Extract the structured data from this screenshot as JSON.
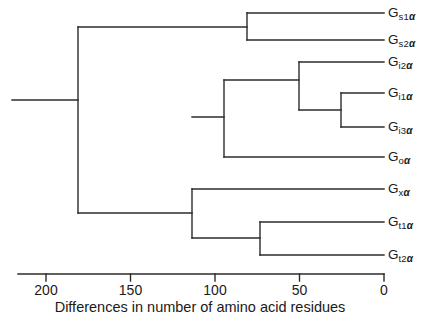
{
  "figure": {
    "type": "dendrogram",
    "caption": "Differences in number of amino acid residues",
    "line_color": "#2b2b2b",
    "background_color": "#ffffff"
  },
  "axis": {
    "orientation": "horizontal",
    "reversed": true,
    "min": 0,
    "max": 200,
    "tick_values": [
      200,
      150,
      100,
      50,
      0
    ],
    "tick_labels": [
      "200",
      "150",
      "100",
      "50",
      "0"
    ],
    "label": "Differences in number of amino acid residues",
    "pixel_for_max": 46,
    "pixel_for_min": 384
  },
  "tips": [
    {
      "id": "gs1a",
      "base": "G",
      "sub": "s1",
      "greek": "α",
      "label": "Gs1α",
      "y": 13,
      "branch_x": 247
    },
    {
      "id": "gs2a",
      "base": "G",
      "sub": "s2",
      "greek": "α",
      "label": "Gs2α",
      "y": 40,
      "branch_x": 247
    },
    {
      "id": "gi2a",
      "base": "G",
      "sub": "i2",
      "greek": "α",
      "label": "Gi2α",
      "y": 62,
      "branch_x": 299
    },
    {
      "id": "gi1a",
      "base": "G",
      "sub": "i1",
      "greek": "α",
      "label": "Gi1α",
      "y": 93,
      "branch_x": 341
    },
    {
      "id": "gi3a",
      "base": "G",
      "sub": "i3",
      "greek": "α",
      "label": "Gi3α",
      "y": 127,
      "branch_x": 341
    },
    {
      "id": "goa",
      "base": "G",
      "sub": "o",
      "greek": "α",
      "label": "Goα",
      "y": 157,
      "branch_x": 224
    },
    {
      "id": "gxa",
      "base": "G",
      "sub": "x",
      "greek": "α",
      "label": "Gxα",
      "y": 189,
      "branch_x": 192
    },
    {
      "id": "gt1a",
      "base": "G",
      "sub": "t1",
      "greek": "α",
      "label": "Gt1α",
      "y": 222,
      "branch_x": 260
    },
    {
      "id": "gt2a",
      "base": "G",
      "sub": "t2",
      "greek": "α",
      "label": "Gt2α",
      "y": 255,
      "branch_x": 260
    }
  ],
  "chart_data": {
    "type": "tree",
    "title": "",
    "xlabel": "Differences in number of amino acid residues",
    "ylabel": "",
    "xlim": [
      200,
      0
    ],
    "grid": false,
    "legend": "none",
    "leaves": [
      "Gs1α",
      "Gs2α",
      "Gi2α",
      "Gi1α",
      "Gi3α",
      "Goα",
      "Gxα",
      "Gt1α",
      "Gt2α"
    ],
    "nodes": [
      {
        "name": "root",
        "height": 178,
        "children": [
          "n_s",
          "n_rest"
        ]
      },
      {
        "name": "n_s",
        "height": 81,
        "children": [
          "Gs1α",
          "Gs2α"
        ]
      },
      {
        "name": "n_rest",
        "height": 114,
        "children": [
          "n_io",
          "n_xt"
        ]
      },
      {
        "name": "n_io",
        "height": 95,
        "children": [
          "n_i",
          "Goα"
        ]
      },
      {
        "name": "n_i",
        "height": 50,
        "children": [
          "Gi2α",
          "n_i13"
        ]
      },
      {
        "name": "n_i13",
        "height": 25,
        "children": [
          "Gi1α",
          "Gi3α"
        ]
      },
      {
        "name": "n_xt",
        "height": 114,
        "children": [
          "Gxα",
          "n_t"
        ]
      },
      {
        "name": "n_t",
        "height": 73,
        "children": [
          "Gt1α",
          "Gt2α"
        ]
      }
    ]
  },
  "geometry": {
    "root_stem_x_start": 12,
    "root_node_x": 78,
    "root_node_y_top": 27,
    "root_node_y_bottom": 213,
    "root_stem_y": 100,
    "tip_line_end_x": 384,
    "segments": [
      {
        "name": "root-stem",
        "x1": 12,
        "y1": 100,
        "x2": 78,
        "y2": 100
      },
      {
        "name": "root-vertical",
        "x1": 78,
        "y1": 27,
        "x2": 78,
        "y2": 213
      },
      {
        "name": "node-s-horizontal",
        "x1": 78,
        "y1": 27,
        "x2": 247,
        "y2": 27
      },
      {
        "name": "node-s-vertical",
        "x1": 247,
        "y1": 13,
        "x2": 247,
        "y2": 40
      },
      {
        "name": "tip-gs1a",
        "x1": 247,
        "y1": 13,
        "x2": 384,
        "y2": 13
      },
      {
        "name": "tip-gs2a",
        "x1": 247,
        "y1": 40,
        "x2": 384,
        "y2": 40
      },
      {
        "name": "node-rest-horizontal",
        "x1": 78,
        "y1": 213,
        "x2": 192,
        "y2": 213
      },
      {
        "name": "node-xt-vertical",
        "x1": 192,
        "y1": 189,
        "x2": 192,
        "y2": 238
      },
      {
        "name": "tip-gxa",
        "x1": 192,
        "y1": 189,
        "x2": 384,
        "y2": 189
      },
      {
        "name": "node-t-horizontal",
        "x1": 192,
        "y1": 238,
        "x2": 260,
        "y2": 238
      },
      {
        "name": "node-t-vertical",
        "x1": 260,
        "y1": 222,
        "x2": 260,
        "y2": 255
      },
      {
        "name": "tip-gt1a",
        "x1": 260,
        "y1": 222,
        "x2": 384,
        "y2": 222
      },
      {
        "name": "tip-gt2a",
        "x1": 260,
        "y1": 255,
        "x2": 384,
        "y2": 255
      },
      {
        "name": "node-io-link",
        "x1": 192,
        "y1": 117,
        "x2": 224,
        "y2": 117
      },
      {
        "name": "node-io-vertical",
        "x1": 224,
        "y1": 80,
        "x2": 224,
        "y2": 157
      },
      {
        "name": "tip-goa",
        "x1": 224,
        "y1": 157,
        "x2": 384,
        "y2": 157
      },
      {
        "name": "node-i-horizontal",
        "x1": 224,
        "y1": 80,
        "x2": 299,
        "y2": 80
      },
      {
        "name": "node-i-vertical",
        "x1": 299,
        "y1": 62,
        "x2": 299,
        "y2": 110
      },
      {
        "name": "tip-gi2a",
        "x1": 299,
        "y1": 62,
        "x2": 384,
        "y2": 62
      },
      {
        "name": "node-i13-horizontal",
        "x1": 299,
        "y1": 110,
        "x2": 341,
        "y2": 110
      },
      {
        "name": "node-i13-vertical",
        "x1": 341,
        "y1": 93,
        "x2": 341,
        "y2": 127
      },
      {
        "name": "tip-gi1a",
        "x1": 341,
        "y1": 93,
        "x2": 384,
        "y2": 93
      },
      {
        "name": "tip-gi3a",
        "x1": 341,
        "y1": 127,
        "x2": 384,
        "y2": 127
      },
      {
        "name": "axis-line",
        "x1": 18,
        "y1": 274,
        "x2": 384,
        "y2": 274
      }
    ]
  }
}
